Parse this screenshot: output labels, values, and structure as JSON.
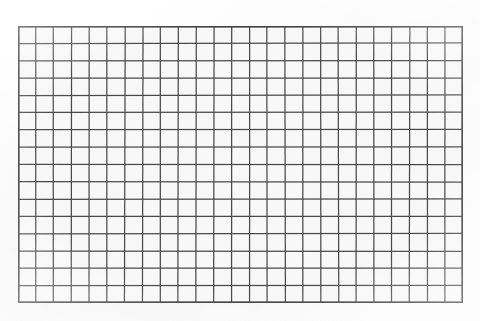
{
  "figure": {
    "kind": "grid-mesh-image",
    "title": "",
    "caption": ""
  },
  "canvas": {
    "width": 480,
    "height": 321,
    "background_color": "#fdfdfd"
  },
  "grid": {
    "left": 18,
    "top": 26,
    "width": 445,
    "height": 277,
    "columns": 25,
    "rows": 16,
    "cell_width": 17.8,
    "cell_height": 17.31,
    "line_color": "#4a4a4a",
    "border_color": "#3f3f3f",
    "cell_fill_color": "#f8f8f8",
    "line_width": 1.25,
    "border_width": 1.6,
    "total_cells": 400,
    "vertical_lines": 26,
    "horizontal_lines": 17
  },
  "chart_data": {
    "type": "heatmap",
    "title": "",
    "xlabel": "",
    "ylabel": "",
    "columns": 25,
    "rows": 16,
    "x": [
      1,
      2,
      3,
      4,
      5,
      6,
      7,
      8,
      9,
      10,
      11,
      12,
      13,
      14,
      15,
      16,
      17,
      18,
      19,
      20,
      21,
      22,
      23,
      24,
      25
    ],
    "y": [
      1,
      2,
      3,
      4,
      5,
      6,
      7,
      8,
      9,
      10,
      11,
      12,
      13,
      14,
      15,
      16
    ],
    "values": "uniform",
    "grid": true,
    "legend": "none",
    "tick_labels_x": [],
    "tick_labels_y": []
  }
}
